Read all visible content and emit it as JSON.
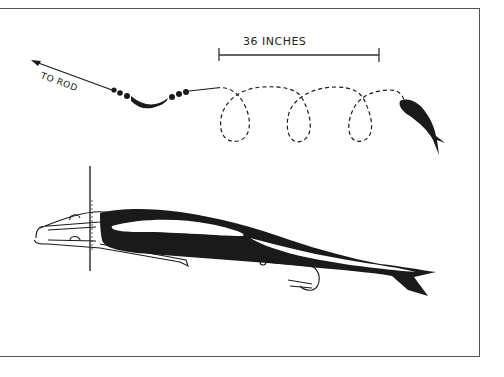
{
  "diagram": {
    "title": "",
    "labels": {
      "to_rod": "TO ROD",
      "measurement": "36 INCHES"
    },
    "components": [
      "line-to-rod",
      "bead-chain",
      "keel-sinker",
      "leader-loops",
      "bait-fish",
      "bait-fish-detail",
      "harness-clip",
      "pin",
      "treble-hook"
    ],
    "colors": {
      "ink": "#1a1a1a",
      "frame": "#555555",
      "background": "#ffffff"
    }
  }
}
